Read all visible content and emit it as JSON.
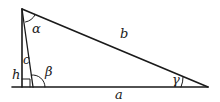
{
  "diagram": {
    "type": "triangle-with-altitude",
    "vertices": {
      "apex": [
        22,
        9
      ],
      "foot_of_c": [
        33,
        87
      ],
      "right": [
        208,
        87
      ],
      "foot_of_h": [
        22,
        87
      ]
    },
    "baseline": {
      "x1": 12,
      "x2": 208,
      "y": 87
    },
    "sides": {
      "a": "a",
      "b": "b",
      "c": "c",
      "h": "h"
    },
    "angles": {
      "alpha": "α",
      "beta": "β",
      "gamma": "γ"
    },
    "stroke_color": "#1a1a1a"
  }
}
